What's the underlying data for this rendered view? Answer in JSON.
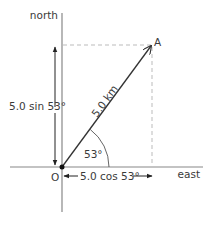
{
  "diagram": {
    "axes": {
      "north_label": "north",
      "east_label": "east",
      "origin_label": "O"
    },
    "vector": {
      "end_point_label": "A",
      "magnitude_label": "5.0 km",
      "magnitude": 5.0,
      "unit": "km",
      "angle_deg": 53,
      "angle_label": "53°"
    },
    "components": {
      "vertical_label": "5.0 sin 53°",
      "horizontal_label": "5.0 cos 53°"
    },
    "colors": {
      "axis": "#888888",
      "vector": "#333333",
      "dashed": "#bbbbbb",
      "text": "#3a3a3a"
    }
  }
}
